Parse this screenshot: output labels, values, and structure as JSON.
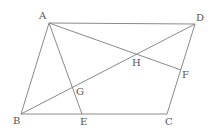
{
  "diagram": {
    "points": {
      "A": {
        "x": 49,
        "y": 23,
        "label": "A",
        "lx": 39,
        "ly": 19
      },
      "D": {
        "x": 195,
        "y": 24,
        "label": "D",
        "lx": 196,
        "ly": 21
      },
      "B": {
        "x": 21,
        "y": 114,
        "label": "B",
        "lx": 13,
        "ly": 124
      },
      "E": {
        "x": 82,
        "y": 114,
        "label": "E",
        "lx": 80,
        "ly": 125
      },
      "C": {
        "x": 167,
        "y": 114,
        "label": "C",
        "lx": 165,
        "ly": 125
      },
      "F": {
        "x": 181,
        "y": 70,
        "label": "F",
        "lx": 182,
        "ly": 78
      },
      "H": {
        "x": 136,
        "y": 54,
        "label": "H",
        "lx": 132,
        "ly": 66
      },
      "G": {
        "x": 73,
        "y": 88,
        "label": "G",
        "lx": 76,
        "ly": 95
      }
    },
    "segments": [
      [
        "A",
        "D"
      ],
      [
        "D",
        "C"
      ],
      [
        "C",
        "B"
      ],
      [
        "B",
        "A"
      ],
      [
        "A",
        "E"
      ],
      [
        "A",
        "F"
      ],
      [
        "B",
        "D"
      ]
    ],
    "colors": {
      "line": "#8a8a8a",
      "label": "#555555",
      "background": "#ffffff"
    }
  }
}
